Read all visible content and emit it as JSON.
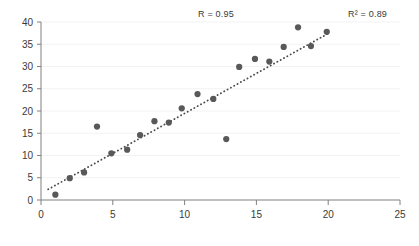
{
  "chart_data": {
    "type": "scatter",
    "title": "",
    "xlabel": "",
    "ylabel": "",
    "xlim": [
      0,
      25
    ],
    "ylim": [
      0,
      40
    ],
    "xticks": [
      0,
      5,
      10,
      15,
      20,
      25
    ],
    "yticks": [
      0,
      5,
      10,
      15,
      20,
      25,
      30,
      35,
      40
    ],
    "grid": true,
    "grid_axis": "y",
    "legend": false,
    "marker_color": "#595959",
    "marker_size": 5,
    "points": [
      {
        "x": 1.0,
        "y": 1.2
      },
      {
        "x": 2.0,
        "y": 4.9
      },
      {
        "x": 3.0,
        "y": 6.2
      },
      {
        "x": 3.9,
        "y": 16.5
      },
      {
        "x": 4.9,
        "y": 10.5
      },
      {
        "x": 6.0,
        "y": 11.3
      },
      {
        "x": 6.9,
        "y": 14.6
      },
      {
        "x": 7.9,
        "y": 17.7
      },
      {
        "x": 8.9,
        "y": 17.4
      },
      {
        "x": 9.8,
        "y": 20.6
      },
      {
        "x": 10.9,
        "y": 23.8
      },
      {
        "x": 12.0,
        "y": 22.7
      },
      {
        "x": 12.9,
        "y": 13.7
      },
      {
        "x": 13.8,
        "y": 29.9
      },
      {
        "x": 14.9,
        "y": 31.7
      },
      {
        "x": 15.9,
        "y": 31.1
      },
      {
        "x": 16.9,
        "y": 34.4
      },
      {
        "x": 17.9,
        "y": 38.8
      },
      {
        "x": 18.8,
        "y": 34.6
      },
      {
        "x": 19.9,
        "y": 37.8
      }
    ],
    "trendline": {
      "style": "dotted",
      "color": "#4a4a4a",
      "x_start": 0.5,
      "y_start": 2.4,
      "x_end": 20.1,
      "y_end": 37.6
    },
    "annotations": [
      {
        "name": "correlation",
        "text": "R = 0.95"
      },
      {
        "name": "r-squared",
        "text": "R² = 0.89"
      }
    ]
  },
  "axes": {
    "x_tick_labels": [
      "0",
      "5",
      "10",
      "15",
      "20",
      "25"
    ],
    "y_tick_labels": [
      "0",
      "5",
      "10",
      "15",
      "20",
      "25",
      "30",
      "35",
      "40"
    ]
  },
  "annotations": {
    "r_value": "R = 0.95",
    "r_squared": "R² = 0.89"
  },
  "colors": {
    "marker": "#595959",
    "trendline": "#4a4a4a",
    "axis": "#808080",
    "grid": "#f2f2f2",
    "text": "#3a3a3a",
    "background": "#ffffff"
  }
}
